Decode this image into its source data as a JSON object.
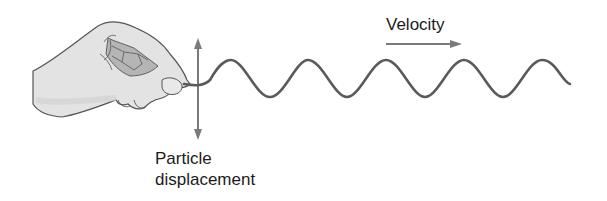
{
  "diagram": {
    "labels": {
      "velocity": "Velocity",
      "particle_line1": "Particle",
      "particle_line2": "displacement"
    },
    "elements": [
      {
        "id": "hand",
        "description": "Hand holding the end of a string"
      },
      {
        "id": "string-wave",
        "description": "Sinusoidal wave traveling to the right",
        "peaks": 5
      },
      {
        "id": "displacement-arrow",
        "description": "Double-headed vertical arrow for particle displacement"
      },
      {
        "id": "velocity-arrow",
        "description": "Horizontal arrow pointing right for wave velocity"
      }
    ],
    "colors": {
      "string": "#5a5a5a",
      "arrow": "#7a7a7a",
      "hand_fill": "#e2e2e2",
      "hand_outline": "#555555",
      "text": "#1c1c1c"
    }
  }
}
